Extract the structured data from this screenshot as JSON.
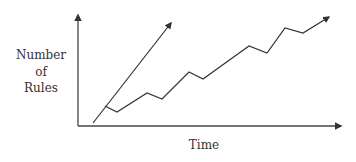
{
  "diagram": {
    "y_axis_label": [
      "Number",
      "of",
      "Rules"
    ],
    "x_axis_label": "Time",
    "colors": {
      "line": "#333333",
      "axis": "#444444",
      "text": "#333333",
      "background": "#ffffff"
    },
    "axes": {
      "origin": [
        78,
        126
      ],
      "y_top": [
        78,
        15
      ],
      "x_end": [
        341,
        126
      ]
    },
    "lines": [
      {
        "name": "straight-growth-line",
        "points": [
          [
            93,
            123
          ],
          [
            171,
            23
          ]
        ]
      },
      {
        "name": "zigzag-growth-line",
        "points": [
          [
            105,
            106
          ],
          [
            117,
            112
          ],
          [
            147,
            93
          ],
          [
            162,
            99
          ],
          [
            189,
            72
          ],
          [
            203,
            79
          ],
          [
            249,
            46
          ],
          [
            267,
            53
          ],
          [
            285,
            28
          ],
          [
            303,
            33
          ],
          [
            329,
            17
          ]
        ]
      }
    ]
  }
}
